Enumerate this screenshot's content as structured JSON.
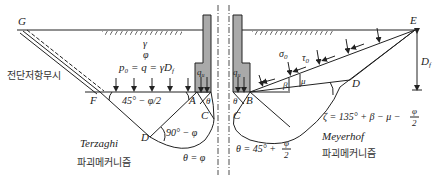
{
  "colors": {
    "line": "#222222",
    "footing_fill": "#a9a9a9",
    "background": "#ffffff"
  },
  "soil": {
    "unit_weight": "γ",
    "friction_angle": "φ",
    "surcharge": "p₀ = q = γD",
    "surcharge_sub": "f"
  },
  "left": {
    "points": {
      "G": "G",
      "F": "F",
      "A": "A",
      "C": "C",
      "D": "D"
    },
    "shear_ignored_note": "전단저항무시",
    "angle_FA": "45° − φ/2",
    "angle_D": "90° − φ",
    "theta_small": "θ",
    "theta_eq": "θ = φ",
    "load": "q",
    "load_sub": "u",
    "method": "Terzaghi",
    "method_caption": "파괴메커니즘"
  },
  "right": {
    "points": {
      "E": "E",
      "B": "B",
      "C": "C",
      "D": "D"
    },
    "sigma": "σ",
    "sigma_sub": "0",
    "tau": "τ",
    "tau_sub": "0",
    "beta": "β",
    "mu": "μ",
    "depth": "D",
    "depth_sub": "f",
    "zeta_eq_main": "ζ = 135° + β − μ −",
    "zeta_frac_num": "φ",
    "zeta_frac_den": "2",
    "theta_small": "θ",
    "theta_eq_main": "θ = 45° +",
    "theta_frac_num": "φ",
    "theta_frac_den": "2",
    "load": "q",
    "load_sub": "u",
    "method": "Meyerhof",
    "method_caption": "파괴메커니즘"
  }
}
